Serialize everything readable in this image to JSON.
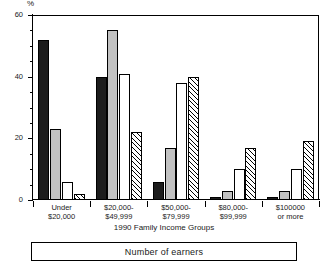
{
  "chart_data": {
    "type": "bar",
    "title": "",
    "xlabel": "1990 Family Income Groups",
    "ylabel": "%",
    "ylim": [
      0,
      60
    ],
    "yticks": [
      0,
      20,
      40,
      60
    ],
    "ytick_labels": [
      "0",
      "20",
      "40",
      "60"
    ],
    "yminor_step": 5,
    "grid": false,
    "legend_position": "bottom",
    "legend_title": "Number of earners",
    "categories": [
      "Under\n$20,000",
      "$20,000-\n$49,999",
      "$50,000-\n$79,999",
      "$80,000-\n$99,999",
      "$100000\nor more"
    ],
    "series": [
      {
        "name": "1 earner",
        "fill": "solid",
        "values": [
          52,
          40,
          6,
          1,
          1
        ]
      },
      {
        "name": "2 earners",
        "fill": "grey",
        "values": [
          23,
          55,
          17,
          3,
          3
        ]
      },
      {
        "name": "3 earners",
        "fill": "white",
        "values": [
          6,
          41,
          38,
          10,
          10
        ]
      },
      {
        "name": "4 earners",
        "fill": "hatch",
        "values": [
          2,
          22,
          40,
          17,
          19
        ]
      }
    ]
  },
  "axis": {
    "y_unit": "%",
    "x_title": "1990 Family Income Groups",
    "categories": [
      {
        "line1": "Under",
        "line2": "$20,000"
      },
      {
        "line1": "$20,000-",
        "line2": "$49,999"
      },
      {
        "line1": "$50,000-",
        "line2": "$79,999"
      },
      {
        "line1": "$80,000-",
        "line2": "$99,999"
      },
      {
        "line1": "$100000",
        "line2": "or more"
      }
    ]
  },
  "legend": {
    "label": "Number of earners"
  },
  "colors": {
    "solid": "#1c1c1c",
    "grey": "#c2c2c2",
    "white": "#ffffff",
    "hatch_line": "#000000",
    "axis": "#000000"
  }
}
